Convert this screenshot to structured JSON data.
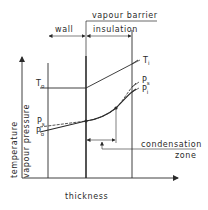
{
  "diagram": {
    "labels": {
      "vapour_barrier": "vapour barrier",
      "wall": "wall",
      "insulation": "insulation",
      "thickness": "thickness",
      "temperature": "temperature",
      "vapour_pressure": "vapour pressure",
      "condensation": "condensation",
      "zone": "zone"
    },
    "symbols": {
      "T_o": {
        "main": "T",
        "sub": "o"
      },
      "T_i": {
        "main": "T",
        "sub": "i"
      },
      "P_s_left": {
        "main": "P",
        "sub": "s"
      },
      "P_o": {
        "main": "P",
        "sub": "o"
      },
      "P_s_right": {
        "main": "P",
        "sub": "s"
      },
      "P_i": {
        "main": "P",
        "sub": "i"
      }
    },
    "axes": {
      "x_label": "thickness",
      "y_label_lines": [
        "temperature",
        "vapour pressure"
      ]
    },
    "layers": [
      {
        "name": "wall"
      },
      {
        "name": "vapour barrier"
      },
      {
        "name": "insulation"
      }
    ],
    "curves": [
      {
        "name": "temperature",
        "from": "T_o",
        "to": "T_i"
      },
      {
        "name": "saturation vapour pressure",
        "from": "P_s",
        "to": "P_s"
      },
      {
        "name": "actual vapour pressure",
        "from": "P_o",
        "to": "P_i"
      }
    ],
    "colors": {
      "line": "#2a2a2a",
      "background": "#ffffff"
    }
  }
}
